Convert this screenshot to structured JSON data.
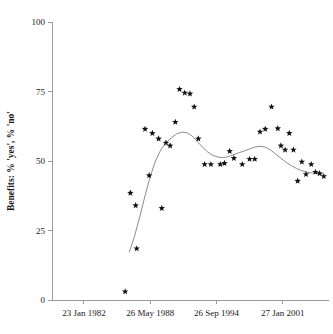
{
  "chart_data": {
    "type": "scatter",
    "title": "",
    "xlabel": "",
    "ylabel": "Benefits: % 'yes', % 'no'",
    "ylim": [
      0,
      100
    ],
    "yticks": [
      0,
      25,
      50,
      75,
      100
    ],
    "yticklabels": [
      "0",
      "25",
      "50",
      "75",
      "100"
    ],
    "xticklabels": [
      "23 Jan 1982",
      "26 May 1988",
      "26 Sep 1994",
      "27 Jan 2001"
    ],
    "xtick_positions": [
      1982.06,
      1988.4,
      1994.73,
      2001.07
    ],
    "xlim": [
      1979.0,
      2005.5
    ],
    "grid": false,
    "legend": false,
    "marker": "star",
    "marker_color": "#111111",
    "curve_color": "#8c8c8c",
    "series": [
      {
        "name": "Benefits percentage",
        "x": [
          1986.0,
          1986.5,
          1987.0,
          1987.1,
          1987.9,
          1988.3,
          1988.6,
          1989.2,
          1989.5,
          1989.9,
          1990.3,
          1990.8,
          1991.2,
          1991.7,
          1992.2,
          1992.6,
          1993.0,
          1993.6,
          1994.2,
          1995.1,
          1995.5,
          1996.0,
          1996.4,
          1997.2,
          1997.9,
          1998.4,
          1998.9,
          1999.4,
          2000.0,
          2000.6,
          2000.9,
          2001.3,
          2001.7,
          2002.1,
          2002.5,
          2002.9,
          2003.3,
          2003.8,
          2004.2,
          2004.6,
          2005.0
        ],
        "y": [
          3.0,
          38.5,
          34.0,
          18.5,
          61.5,
          44.8,
          60.0,
          58.0,
          33.0,
          56.5,
          55.5,
          64.0,
          75.8,
          74.5,
          74.2,
          69.5,
          58.0,
          48.8,
          48.8,
          48.8,
          49.2,
          53.5,
          51.0,
          48.8,
          50.7,
          50.7,
          60.5,
          61.5,
          69.5,
          61.7,
          55.5,
          54.0,
          60.0,
          54.0,
          42.8,
          49.7,
          45.2,
          48.8,
          46.0,
          45.5,
          44.5
        ]
      }
    ],
    "fit_curve": {
      "name": "smoothed trend",
      "x": [
        1986.4,
        1986.9,
        1987.4,
        1987.9,
        1988.4,
        1988.9,
        1989.4,
        1989.9,
        1990.4,
        1990.9,
        1991.4,
        1991.9,
        1992.4,
        1992.9,
        1993.4,
        1993.9,
        1994.4,
        1994.9,
        1995.4,
        1995.9,
        1996.4,
        1996.9,
        1997.4,
        1997.9,
        1998.4,
        1998.9,
        1999.4,
        1999.9,
        2000.4,
        2000.9,
        2001.4,
        2001.9,
        2002.4,
        2002.9,
        2003.4,
        2003.9,
        2004.4,
        2004.9
      ],
      "y": [
        17.3,
        23.0,
        30.0,
        37.5,
        44.5,
        50.0,
        54.0,
        56.5,
        58.3,
        59.7,
        60.4,
        60.2,
        59.0,
        57.0,
        55.0,
        53.2,
        52.0,
        51.4,
        51.2,
        51.6,
        52.3,
        53.0,
        53.6,
        54.3,
        55.0,
        55.3,
        55.0,
        54.0,
        52.5,
        51.0,
        49.5,
        48.3,
        47.3,
        46.5,
        46.0,
        45.7,
        45.5,
        45.4
      ]
    }
  },
  "axes": {
    "y_axis_name": "y-axis",
    "x_axis_name": "x-axis"
  }
}
